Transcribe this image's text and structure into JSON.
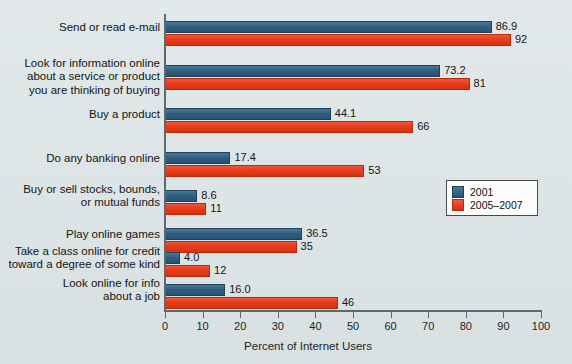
{
  "chart_data": {
    "type": "bar",
    "orientation": "horizontal",
    "title": "",
    "xlabel": "Percent of Internet Users",
    "ylabel": "",
    "xlim": [
      0,
      100
    ],
    "xticks": [
      0,
      10,
      20,
      30,
      40,
      50,
      60,
      70,
      80,
      90,
      100
    ],
    "xtick_labels": [
      "0",
      "10",
      "20",
      "30",
      "40",
      "50",
      "60",
      "70",
      "80",
      "90",
      "100"
    ],
    "grid": false,
    "legend_position": "center-right",
    "categories": [
      "Send or read e-mail",
      "Look for information online\nabout a service or product\nyou are thinking of buying",
      "Buy a product",
      "Do any banking online",
      "Buy or sell stocks, bounds,\nor mutual funds",
      "Play online games",
      "Take a class online for credit\ntoward a degree of some kind",
      "Look online for info\nabout a job"
    ],
    "series": [
      {
        "name": "2001",
        "color": "#2f5f80",
        "values": [
          86.9,
          73.2,
          44.1,
          17.4,
          8.6,
          36.5,
          4.0,
          16.0
        ],
        "value_labels": [
          "86.9",
          "73.2",
          "44.1",
          "17.4",
          "8.6",
          "36.5",
          "4.0",
          "16.0"
        ]
      },
      {
        "name": "2005-2007",
        "color": "#e83c18",
        "values": [
          92,
          81,
          66,
          53,
          11,
          35,
          12,
          46
        ],
        "value_labels": [
          "92",
          "81",
          "66",
          "53",
          "11",
          "35",
          "12",
          "46"
        ]
      }
    ]
  },
  "legend": {
    "items": [
      {
        "label": "2001",
        "color": "#2f5f80"
      },
      {
        "label": "2005–2007",
        "color": "#e83c18"
      }
    ]
  },
  "axis": {
    "x_title": "Percent of Internet Users"
  },
  "colors": {
    "background": "#dde5e6",
    "series_2001": "#2f5f80",
    "series_2005_2007": "#e83c18",
    "axis": "#5a6a70",
    "text": "#141414"
  }
}
